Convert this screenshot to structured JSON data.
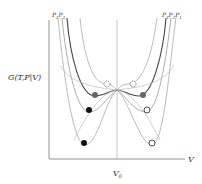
{
  "diagram": {
    "y_label": "G(T,P|V)",
    "x_label": "V",
    "x_tick": "V",
    "x_tick_sub": "0",
    "left_labels": [
      {
        "main": "P",
        "sub": "1"
      },
      {
        "main": "P",
        "sub": "2"
      }
    ],
    "right_labels": [
      {
        "main": "P",
        "sub": "3"
      },
      {
        "main": "P",
        "sub": "2"
      },
      {
        "main": "P",
        "sub": "1"
      }
    ],
    "colors": {
      "axis": "#777777",
      "curve_light": "#aaaaaa",
      "curve_dark": "#444444",
      "filled_dark": "#111111",
      "filled_gray": "#666666",
      "open": "#ffffff"
    }
  }
}
